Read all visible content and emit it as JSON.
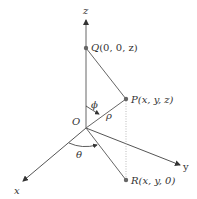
{
  "diagram": {
    "type": "spherical-coordinates",
    "axes": {
      "z": "z",
      "x": "x",
      "y": "y"
    },
    "origin": "O",
    "points": {
      "Q": {
        "name": "Q",
        "coords": "(0, 0, z)"
      },
      "P": {
        "name": "P",
        "coords": "(x, y, z)"
      },
      "R": {
        "name": "R",
        "coords": "(x, y, 0)"
      }
    },
    "angles": {
      "phi": "ϕ",
      "theta": "θ"
    },
    "radius": "ρ",
    "colors": {
      "line": "#555555",
      "point": "#666666",
      "dotted": "#bbbbbb"
    }
  }
}
